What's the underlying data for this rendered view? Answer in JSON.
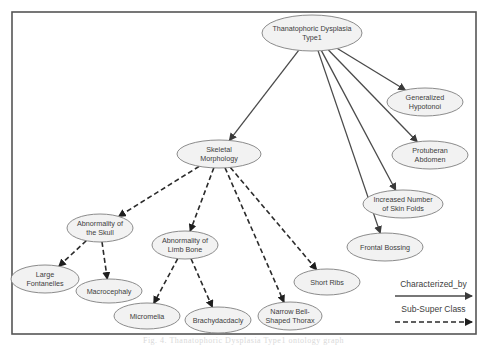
{
  "diagram": {
    "frame": {
      "x": 12,
      "y": 12,
      "width": 464,
      "height": 322
    },
    "nodes": [
      {
        "id": "root",
        "lines": [
          "Thanatophoric Dysplasia",
          "Type1"
        ],
        "cx": 312,
        "cy": 33,
        "rx": 50,
        "ry": 18
      },
      {
        "id": "hypotonoi",
        "lines": [
          "Generalized",
          "Hypotonoi"
        ],
        "cx": 425,
        "cy": 102,
        "rx": 38,
        "ry": 14
      },
      {
        "id": "abdomen",
        "lines": [
          "Protuberan",
          "Abdomen"
        ],
        "cx": 430,
        "cy": 155,
        "rx": 38,
        "ry": 14
      },
      {
        "id": "skinfolds",
        "lines": [
          "Increased Number",
          "of Skin Folds"
        ],
        "cx": 403,
        "cy": 204,
        "rx": 40,
        "ry": 14
      },
      {
        "id": "frontal",
        "lines": [
          "Frontal Bossing"
        ],
        "cx": 385,
        "cy": 247,
        "rx": 38,
        "ry": 14
      },
      {
        "id": "skeletal",
        "lines": [
          "Skeletal",
          "Morphology"
        ],
        "cx": 219,
        "cy": 154,
        "rx": 42,
        "ry": 14
      },
      {
        "id": "skull",
        "lines": [
          "Abnormality of",
          "the Skull"
        ],
        "cx": 100,
        "cy": 228,
        "rx": 33,
        "ry": 14
      },
      {
        "id": "limb",
        "lines": [
          "Abnormality of",
          "Limb Bone"
        ],
        "cx": 185,
        "cy": 245,
        "rx": 33,
        "ry": 14
      },
      {
        "id": "fontanelles",
        "lines": [
          "Large",
          "Fontanelles"
        ],
        "cx": 45,
        "cy": 279,
        "rx": 34,
        "ry": 14
      },
      {
        "id": "macrocephaly",
        "lines": [
          "Macrocephaly"
        ],
        "cx": 109,
        "cy": 291,
        "rx": 33,
        "ry": 12
      },
      {
        "id": "shortribs",
        "lines": [
          "Short Ribs"
        ],
        "cx": 327,
        "cy": 282,
        "rx": 33,
        "ry": 13
      },
      {
        "id": "micromelia",
        "lines": [
          "Micromelia"
        ],
        "cx": 147,
        "cy": 316,
        "rx": 33,
        "ry": 13
      },
      {
        "id": "brachydactyly",
        "lines": [
          "Brachydacdacly"
        ],
        "cx": 218,
        "cy": 320,
        "rx": 33,
        "ry": 13
      },
      {
        "id": "thorax",
        "lines": [
          "Narrow Bell-",
          "Shaped Thorax"
        ],
        "cx": 290,
        "cy": 316,
        "rx": 32,
        "ry": 14
      }
    ],
    "edges": [
      {
        "from": "root",
        "to": "hypotonoi",
        "type": "Characterized_by"
      },
      {
        "from": "root",
        "to": "abdomen",
        "type": "Characterized_by"
      },
      {
        "from": "root",
        "to": "skinfolds",
        "type": "Characterized_by"
      },
      {
        "from": "root",
        "to": "frontal",
        "type": "Characterized_by"
      },
      {
        "from": "root",
        "to": "skeletal",
        "type": "Characterized_by"
      },
      {
        "from": "skeletal",
        "to": "skull",
        "type": "Sub-Super Class"
      },
      {
        "from": "skeletal",
        "to": "limb",
        "type": "Sub-Super Class"
      },
      {
        "from": "skeletal",
        "to": "thorax",
        "type": "Sub-Super Class"
      },
      {
        "from": "skeletal",
        "to": "shortribs",
        "type": "Sub-Super Class"
      },
      {
        "from": "skull",
        "to": "fontanelles",
        "type": "Sub-Super Class"
      },
      {
        "from": "skull",
        "to": "macrocephaly",
        "type": "Sub-Super Class"
      },
      {
        "from": "limb",
        "to": "micromelia",
        "type": "Sub-Super Class"
      },
      {
        "from": "limb",
        "to": "brachydactyly",
        "type": "Sub-Super Class"
      }
    ],
    "legend": [
      {
        "label": "Characterized_by",
        "style": "solid",
        "x1": 395,
        "x2": 472,
        "y": 296,
        "label_y": 287
      },
      {
        "label": "Sub-Super Class",
        "style": "dashed",
        "x1": 395,
        "x2": 472,
        "y": 322,
        "label_y": 312
      }
    ]
  },
  "caption": "Fig. 4. Thanatophoric Dysplasia Type1 ontology graph"
}
